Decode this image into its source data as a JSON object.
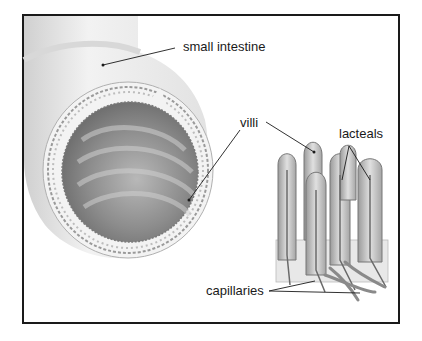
{
  "diagram": {
    "labels": {
      "small_intestine": "small intestine",
      "villi": "villi",
      "lacteals": "lacteals",
      "capillaries": "capillaries"
    },
    "colors": {
      "frame": "#1a1a1a",
      "tissue_light": "#e6e6e6",
      "tissue_mid": "#b5b5b5",
      "tissue_dark": "#7a7a7a",
      "leader_line": "#1a1a1a"
    }
  }
}
